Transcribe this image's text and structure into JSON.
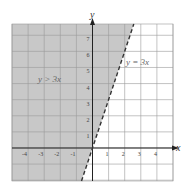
{
  "chart_data": {
    "type": "area",
    "title": "",
    "xlabel": "x",
    "ylabel": "y",
    "xlim": [
      -5,
      5
    ],
    "ylim": [
      -2.05,
      7.7
    ],
    "grid": true,
    "x_ticks": [
      -4,
      -3,
      -2,
      -1,
      1,
      2,
      3,
      4
    ],
    "y_ticks": [
      1,
      2,
      3,
      4,
      5,
      6,
      7
    ],
    "boundary_line": {
      "equation": "y = 3x",
      "slope": 3,
      "intercept": 0,
      "style": "dashed"
    },
    "shaded_region": {
      "inequality": "y > 3x",
      "side": "above-left"
    },
    "annotations": [
      {
        "text": "y > 3x",
        "x": -3.5,
        "y": 4.2
      },
      {
        "text": "y = 3x",
        "x": 2.1,
        "y": 5.3
      }
    ]
  },
  "labels": {
    "x_axis": "x",
    "y_axis": "y",
    "region": "y > 3x",
    "line": "y = 3x"
  },
  "colors": {
    "shade": "#c8c8c8",
    "grid": "#9a9a9a",
    "axis": "#222222",
    "line": "#333333"
  }
}
